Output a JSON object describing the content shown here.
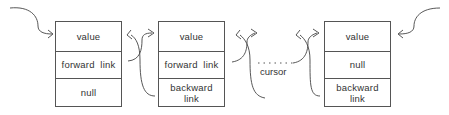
{
  "nodes": [
    {
      "id": "first",
      "cells": [
        "value",
        "forward  link",
        "null"
      ]
    },
    {
      "id": "middle",
      "cells": [
        "value",
        "forward  link",
        "backward link"
      ]
    },
    {
      "id": "last",
      "cells": [
        "value",
        "null",
        "backward link"
      ]
    }
  ],
  "cursor_label": "cursor",
  "ellipsis": ". . . . ."
}
